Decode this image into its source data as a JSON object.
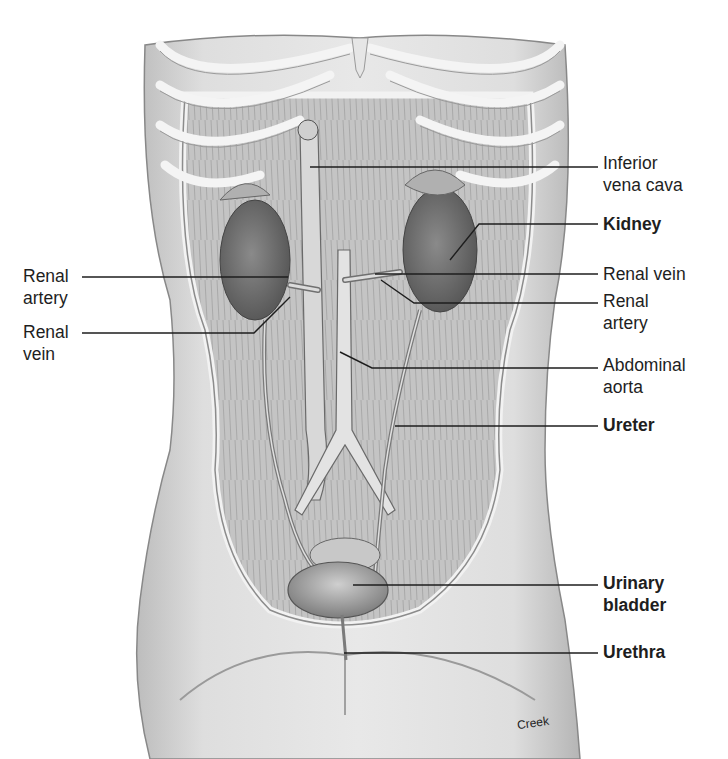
{
  "figure": {
    "colors": {
      "background": "#ffffff",
      "line": "#1e1e1e",
      "tissue_light": "#d9d9d9",
      "tissue_mid": "#a8a8a8",
      "tissue_dark": "#6e6e6e"
    },
    "signature": "Creek"
  },
  "labels": {
    "right": [
      {
        "id": "inferior-vena-cava",
        "lines": [
          "Inferior",
          "vena cava"
        ],
        "bold": false
      },
      {
        "id": "kidney",
        "lines": [
          "Kidney"
        ],
        "bold": true
      },
      {
        "id": "renal-vein-right",
        "lines": [
          "Renal vein"
        ],
        "bold": false
      },
      {
        "id": "renal-artery-right",
        "lines": [
          "Renal",
          "artery"
        ],
        "bold": false
      },
      {
        "id": "abdominal-aorta",
        "lines": [
          "Abdominal",
          "aorta"
        ],
        "bold": false
      },
      {
        "id": "ureter",
        "lines": [
          "Ureter"
        ],
        "bold": true
      },
      {
        "id": "urinary-bladder",
        "lines": [
          "Urinary",
          "bladder"
        ],
        "bold": true
      },
      {
        "id": "urethra",
        "lines": [
          "Urethra"
        ],
        "bold": true
      }
    ],
    "left": [
      {
        "id": "renal-artery-left",
        "lines": [
          "Renal",
          "artery"
        ],
        "bold": false
      },
      {
        "id": "renal-vein-left",
        "lines": [
          "Renal",
          "vein"
        ],
        "bold": false
      }
    ]
  }
}
